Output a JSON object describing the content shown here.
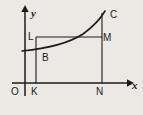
{
  "figure": {
    "type": "math-diagram",
    "background_color": "#ece9e4",
    "ink_color": "#1b1b1b",
    "axes": {
      "x_axis_label": "x",
      "y_axis_label": "y",
      "origin_label": "O",
      "x_axis_has_arrow": true,
      "y_axis_has_arrow": true
    },
    "labels": [
      {
        "id": "y-axis-label",
        "text": "y",
        "x": 33,
        "y": 15
      },
      {
        "id": "x-axis-label",
        "text": "x",
        "x": 133,
        "y": 89
      },
      {
        "id": "origin-label",
        "text": "O",
        "x": 13,
        "y": 94
      },
      {
        "id": "point-L-label",
        "text": "L",
        "x": 29,
        "y": 39
      },
      {
        "id": "point-M-label",
        "text": "M",
        "x": 104,
        "y": 40
      },
      {
        "id": "point-C-label",
        "text": "C",
        "x": 111,
        "y": 17
      },
      {
        "id": "point-B-label",
        "text": "B",
        "x": 43,
        "y": 60
      },
      {
        "id": "point-K-label",
        "text": "K",
        "x": 32,
        "y": 94
      },
      {
        "id": "point-N-label",
        "text": "N",
        "x": 97,
        "y": 94
      }
    ],
    "geometry": {
      "x_axis": {
        "x1": 12,
        "y1": 83,
        "x2": 127,
        "y2": 83
      },
      "y_axis": {
        "x1": 25,
        "y1": 96,
        "x2": 25,
        "y2": 9
      },
      "vertical_K": {
        "x1": 36,
        "y1": 83,
        "x2": 36,
        "y2": 37
      },
      "vertical_N": {
        "x1": 102,
        "y1": 83,
        "x2": 102,
        "y2": 13
      },
      "horizontal_LM": {
        "x1": 36,
        "y1": 37,
        "x2": 102,
        "y2": 37
      },
      "curve_path": "M 22 51 C 45 48, 72 42, 88 30 C 97 23, 102 17, 104 12"
    },
    "points": [
      "O",
      "K",
      "N",
      "L",
      "M",
      "B",
      "C"
    ]
  }
}
